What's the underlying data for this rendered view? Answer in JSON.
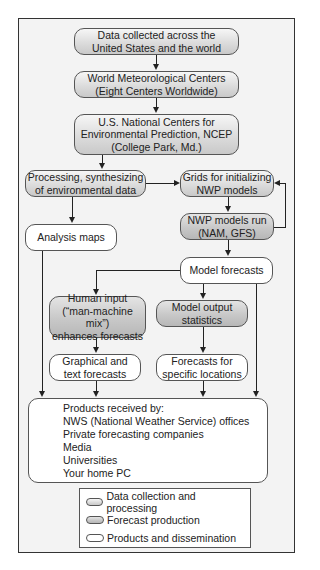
{
  "diagram": {
    "type": "flowchart",
    "nodes": {
      "data_collected": {
        "lines": [
          "Data collected across the",
          "United States and the world"
        ],
        "category": "data_collection"
      },
      "world_met": {
        "lines": [
          "World Meteorological Centers",
          "(Eight Centers Worldwide)"
        ],
        "category": "data_collection"
      },
      "ncep": {
        "lines": [
          "U.S. National Centers for",
          "Environmental Prediction, NCEP",
          "(College Park, Md.)"
        ],
        "category": "data_collection"
      },
      "processing": {
        "lines": [
          "Processing, synthesizing",
          "of environmental data"
        ],
        "category": "data_collection"
      },
      "grids": {
        "lines": [
          "Grids for initializing",
          "NWP models"
        ],
        "category": "data_collection"
      },
      "nwp_run": {
        "lines": [
          "NWP models run",
          "(NAM, GFS)"
        ],
        "category": "forecast_production"
      },
      "analysis_maps": {
        "lines": [
          "Analysis maps"
        ],
        "category": "products"
      },
      "model_forecasts": {
        "lines": [
          "Model forecasts"
        ],
        "category": "products"
      },
      "human_input": {
        "lines": [
          "Human input",
          "(“man-machine mix”)",
          "enhances forecasts"
        ],
        "category": "forecast_production"
      },
      "mos": {
        "lines": [
          "Model output",
          "statistics"
        ],
        "category": "forecast_production"
      },
      "graphical": {
        "lines": [
          "Graphical and",
          "text forecasts"
        ],
        "category": "products"
      },
      "specific": {
        "lines": [
          "Forecasts for",
          "specific locations"
        ],
        "category": "products"
      },
      "products": {
        "lines": [
          "Products received by:",
          "NWS (National Weather Service) offices",
          "Private forecasting companies",
          "Media",
          "Universities",
          "Your home PC"
        ],
        "category": "products"
      }
    },
    "edges": [
      [
        "data_collected",
        "world_met"
      ],
      [
        "world_met",
        "ncep"
      ],
      [
        "ncep",
        "processing"
      ],
      [
        "processing",
        "grids"
      ],
      [
        "processing",
        "analysis_maps"
      ],
      [
        "grids",
        "nwp_run"
      ],
      [
        "nwp_run",
        "grids"
      ],
      [
        "nwp_run",
        "model_forecasts"
      ],
      [
        "model_forecasts",
        "human_input"
      ],
      [
        "model_forecasts",
        "mos"
      ],
      [
        "model_forecasts",
        "products"
      ],
      [
        "human_input",
        "graphical"
      ],
      [
        "mos",
        "specific"
      ],
      [
        "analysis_maps",
        "products"
      ],
      [
        "graphical",
        "products"
      ],
      [
        "specific",
        "products"
      ]
    ]
  },
  "legend": {
    "items": [
      {
        "label": "Data collection and processing",
        "category": "data_collection"
      },
      {
        "label": "Forecast production",
        "category": "forecast_production"
      },
      {
        "label": "Products and dissemination",
        "category": "products"
      }
    ]
  },
  "colors": {
    "data_collection": "#dcdcdc",
    "forecast_production": "#c8c8c8",
    "products": "#ffffff",
    "frame_background": "#f3f3f3",
    "line": "#222222"
  }
}
